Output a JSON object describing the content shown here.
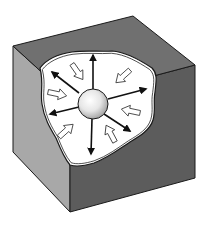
{
  "diagram": {
    "colors": {
      "background": "#ffffff",
      "top_face": "#707070",
      "left_face": "#a8a8a8",
      "front_face": "#5c5c5c",
      "cavity": "#ffffff",
      "outline": "#1a1a1a",
      "outward_arrow": "#111111",
      "inward_arrow_fill": "#ffffff",
      "sphere_light": "#ffffff",
      "sphere_dark": "#a0a0a0"
    },
    "cube": {
      "top_face": "13,46 133,16 195,65 70,98",
      "left_face": "13,46 70,98 70,212 13,152",
      "front_face": "70,98 195,65 195,178 70,212"
    },
    "cavity_path": "M40,68 C46,60 58,54 72,52 C86,50 100,52 112,51 C126,52 140,60 152,68 C158,74 156,82 155,92 C153,102 156,110 153,120 C150,130 140,136 130,142 C118,150 108,158 94,163 C84,166 76,167 70,165 C64,158 60,148 56,138 C50,128 44,118 42,104 C40,92 44,84 40,68 Z",
    "sphere": {
      "cx": 93,
      "cy": 104,
      "r": 15
    },
    "outward_arrows": [
      {
        "x1": 93,
        "y1": 89,
        "x2": 93,
        "y2": 55
      },
      {
        "x1": 79,
        "y1": 93,
        "x2": 52,
        "y2": 72
      },
      {
        "x1": 108,
        "y1": 99,
        "x2": 146,
        "y2": 89
      },
      {
        "x1": 79,
        "y1": 107,
        "x2": 50,
        "y2": 114
      },
      {
        "x1": 104,
        "y1": 114,
        "x2": 130,
        "y2": 131
      },
      {
        "x1": 92,
        "y1": 119,
        "x2": 91,
        "y2": 154
      }
    ],
    "inward_arrows": [
      {
        "x": 72,
        "y": 64,
        "angle": 55
      },
      {
        "x": 48,
        "y": 92,
        "angle": 12
      },
      {
        "x": 130,
        "y": 70,
        "angle": 138
      },
      {
        "x": 140,
        "y": 113,
        "angle": 192
      },
      {
        "x": 59,
        "y": 137,
        "angle": -42
      },
      {
        "x": 115,
        "y": 142,
        "angle": -118
      }
    ]
  }
}
